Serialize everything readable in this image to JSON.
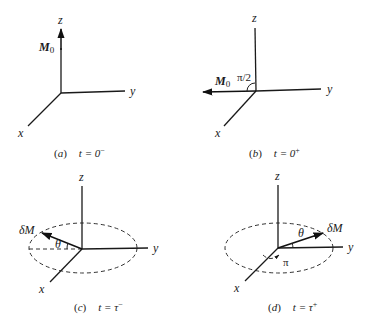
{
  "figure": {
    "panels": [
      {
        "id": "a",
        "caption_letter": "a",
        "caption_time": "t = 0",
        "caption_sup": "−",
        "axes": {
          "x": "x",
          "y": "y",
          "z": "z"
        },
        "vector_label": "M",
        "vector_sub": "0",
        "vector_direction": "+z"
      },
      {
        "id": "b",
        "caption_letter": "b",
        "caption_time": "t = 0",
        "caption_sup": "+",
        "axes": {
          "x": "x",
          "y": "y",
          "z": "z"
        },
        "vector_label": "M",
        "vector_sub": "0",
        "vector_direction": "−y",
        "angle_label": "π/2"
      },
      {
        "id": "c",
        "caption_letter": "c",
        "caption_time": "t = τ",
        "caption_sup": "−",
        "axes": {
          "x": "x",
          "y": "y",
          "z": "z"
        },
        "vector_label": "δM",
        "angle_label": "θ"
      },
      {
        "id": "d",
        "caption_letter": "d",
        "caption_time": "t = τ",
        "caption_sup": "+",
        "axes": {
          "x": "x",
          "y": "y",
          "z": "z"
        },
        "vector_label": "δM",
        "angle_label": "θ",
        "rotation_label": "π"
      }
    ],
    "colors": {
      "ink": "#1a1a1a",
      "background": "#ffffff"
    }
  }
}
